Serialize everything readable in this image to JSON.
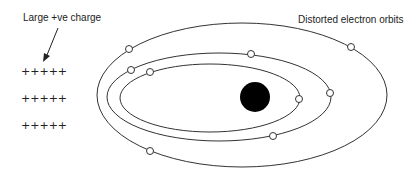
{
  "labels": {
    "charge": "Large +ve charge",
    "orbits": "Distorted electron orbits"
  },
  "charges": [
    "+++++",
    "+++++",
    "+++++"
  ],
  "colors": {
    "line": "#333333",
    "nucleus": "#000000",
    "electron_fill": "#ffffff"
  },
  "diagram": {
    "orbits": [
      {
        "name": "outer",
        "cx": 242,
        "cy": 95,
        "rx": 145,
        "ry": 72
      },
      {
        "name": "middle",
        "cx": 219,
        "cy": 97,
        "rx": 112,
        "ry": 44
      },
      {
        "name": "inner",
        "cx": 210,
        "cy": 98,
        "rx": 90,
        "ry": 34
      }
    ],
    "nucleus": {
      "cx": 255,
      "cy": 97,
      "r": 15
    },
    "electrons": [
      {
        "cx": 129,
        "cy": 49
      },
      {
        "cx": 351,
        "cy": 47
      },
      {
        "cx": 131,
        "cy": 70
      },
      {
        "cx": 251,
        "cy": 54
      },
      {
        "cx": 330,
        "cy": 93
      },
      {
        "cx": 273,
        "cy": 136
      },
      {
        "cx": 150,
        "cy": 72
      },
      {
        "cx": 299,
        "cy": 99
      },
      {
        "cx": 150,
        "cy": 151
      }
    ]
  }
}
